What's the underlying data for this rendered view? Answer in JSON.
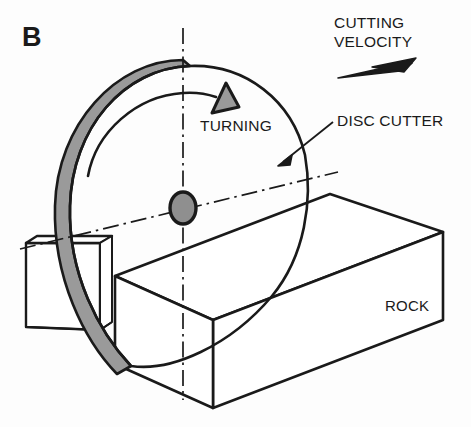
{
  "figure": {
    "panel_label": "B",
    "caption_labels": {
      "cutting_velocity_line1": "CUTTING",
      "cutting_velocity_line2": "VELOCITY",
      "turning": "TURNING",
      "disc_cutter": "DISC CUTTER",
      "rock": "ROCK"
    },
    "icons": {
      "velocity_arrow": "velocity-dart-arrow-icon",
      "turning_arrow": "rotation-arrowhead-icon",
      "leader_arrow": "leader-arrowhead-icon",
      "hub": "disc-hub-icon"
    },
    "colors": {
      "stroke": "#1a1a1a",
      "shade_fill": "#9a9a9a",
      "hub_fill": "#8f8f8f",
      "background": "#fdfdfd",
      "thin_stroke": "#222222"
    },
    "geometry_notes": {
      "disc_center_x": 183,
      "disc_center_y": 208,
      "disc_radius_x": 128,
      "disc_radius_y": 148,
      "axle_axis": "dash-dot",
      "vertical_axis": "dash-dot"
    }
  }
}
